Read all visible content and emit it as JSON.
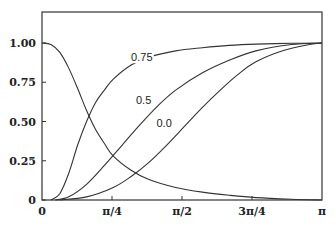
{
  "chart_data": {
    "type": "line",
    "title": "",
    "xlabel": "",
    "ylabel": "",
    "xlim": [
      0,
      3.14159
    ],
    "ylim": [
      0,
      1.1
    ],
    "grid": false,
    "x_ticks": [
      {
        "value": 0,
        "label": "0"
      },
      {
        "value": 0.7854,
        "label": "π/4"
      },
      {
        "value": 1.5708,
        "label": "π/2"
      },
      {
        "value": 2.3562,
        "label": "3π/4"
      },
      {
        "value": 3.14159,
        "label": "π"
      }
    ],
    "y_ticks": [
      {
        "value": 0,
        "label": "0"
      },
      {
        "value": 0.25,
        "label": "0.25"
      },
      {
        "value": 0.5,
        "label": "0.50"
      },
      {
        "value": 0.75,
        "label": "0.75"
      },
      {
        "value": 1.0,
        "label": "1.00"
      }
    ],
    "series": [
      {
        "name": "decreasing",
        "label": "",
        "x": [
          0,
          0.1,
          0.2,
          0.3,
          0.4,
          0.5,
          0.6,
          0.7,
          0.8,
          1.0,
          1.2,
          1.5,
          1.8,
          2.1,
          2.4,
          2.8,
          3.14
        ],
        "y": [
          1.0,
          0.99,
          0.94,
          0.84,
          0.71,
          0.57,
          0.45,
          0.36,
          0.28,
          0.19,
          0.13,
          0.08,
          0.05,
          0.03,
          0.015,
          0.005,
          0.0
        ]
      },
      {
        "name": "0.75",
        "label": "0.75",
        "x": [
          0.1,
          0.2,
          0.3,
          0.4,
          0.5,
          0.6,
          0.7,
          0.8,
          1.0,
          1.2,
          1.5,
          1.8,
          2.1,
          2.4,
          2.8,
          3.14
        ],
        "y": [
          0.0,
          0.04,
          0.17,
          0.35,
          0.5,
          0.62,
          0.7,
          0.77,
          0.86,
          0.91,
          0.95,
          0.97,
          0.985,
          0.993,
          0.998,
          1.0
        ]
      },
      {
        "name": "0.5",
        "label": "0.5",
        "x": [
          0.15,
          0.3,
          0.5,
          0.7,
          0.9,
          1.1,
          1.3,
          1.5,
          1.8,
          2.1,
          2.4,
          2.8,
          3.14
        ],
        "y": [
          0.0,
          0.02,
          0.1,
          0.22,
          0.35,
          0.48,
          0.6,
          0.7,
          0.81,
          0.89,
          0.95,
          0.99,
          1.0
        ]
      },
      {
        "name": "0.0",
        "label": "0.0",
        "x": [
          0.2,
          0.5,
          0.8,
          1.0,
          1.2,
          1.4,
          1.6,
          1.8,
          2.0,
          2.2,
          2.4,
          2.7,
          3.0,
          3.14
        ],
        "y": [
          0.0,
          0.02,
          0.08,
          0.15,
          0.24,
          0.35,
          0.47,
          0.59,
          0.7,
          0.8,
          0.88,
          0.95,
          0.99,
          1.0
        ]
      }
    ],
    "annotations": [
      {
        "text": "0.75",
        "x": 1.12,
        "y": 0.89
      },
      {
        "text": "0.5",
        "x": 1.14,
        "y": 0.62
      },
      {
        "text": "0.0",
        "x": 1.37,
        "y": 0.47
      }
    ]
  }
}
